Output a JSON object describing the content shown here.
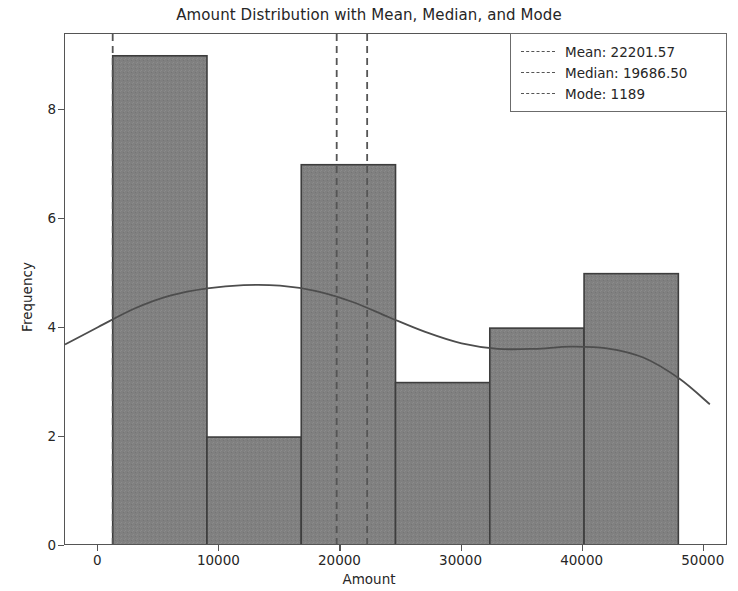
{
  "chart_data": {
    "type": "bar",
    "title": "Amount Distribution with Mean, Median, and Mode",
    "xlabel": "Amount",
    "ylabel": "Frequency",
    "xlim": [
      -2750,
      52000
    ],
    "ylim": [
      0,
      9.4
    ],
    "grid": false,
    "legend_position": "upper right",
    "bin_edges": [
      1189,
      8974,
      16759,
      24544,
      32329,
      40114,
      47899
    ],
    "categories": [
      "1189-8974",
      "8974-16759",
      "16759-24544",
      "24544-32329",
      "32329-40114",
      "40114-47899"
    ],
    "values": [
      9,
      2,
      7,
      3,
      4,
      5
    ],
    "xticks": [
      0,
      10000,
      20000,
      30000,
      40000,
      50000
    ],
    "xtick_labels": [
      "0",
      "10000",
      "20000",
      "30000",
      "40000",
      "50000"
    ],
    "yticks": [
      0,
      2,
      4,
      6,
      8
    ],
    "ytick_labels": [
      "0",
      "2",
      "4",
      "6",
      "8"
    ],
    "bar_facecolor": "#808080",
    "bar_edgecolor": "#3d3d3d",
    "kde_color": "#4d4d4d",
    "kde_points": [
      [
        -2750,
        3.7
      ],
      [
        0,
        4.02
      ],
      [
        3000,
        4.36
      ],
      [
        6000,
        4.6
      ],
      [
        9000,
        4.73
      ],
      [
        12000,
        4.79
      ],
      [
        15000,
        4.78
      ],
      [
        18000,
        4.68
      ],
      [
        21000,
        4.48
      ],
      [
        24000,
        4.2
      ],
      [
        27000,
        3.93
      ],
      [
        30000,
        3.72
      ],
      [
        33000,
        3.62
      ],
      [
        36000,
        3.62
      ],
      [
        39000,
        3.66
      ],
      [
        42000,
        3.63
      ],
      [
        45000,
        3.46
      ],
      [
        48000,
        3.07
      ],
      [
        50500,
        2.6
      ]
    ],
    "vlines": [
      {
        "name": "mean",
        "value": 22201.57,
        "color": "#555555",
        "style": "dashed"
      },
      {
        "name": "median",
        "value": 19686.5,
        "color": "#555555",
        "style": "dashed"
      },
      {
        "name": "mode",
        "value": 1189,
        "color": "#555555",
        "style": "dashed"
      }
    ]
  },
  "legend": {
    "mean_label": "Mean: 22201.57",
    "median_label": "Median: 19686.50",
    "mode_label": "Mode: 1189"
  }
}
